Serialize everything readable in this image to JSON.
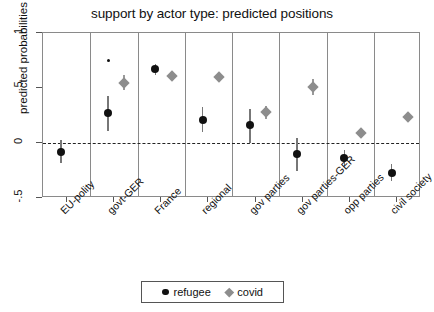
{
  "chart_data": {
    "type": "scatter",
    "title": "support by actor type: predicted positions",
    "xlabel": "",
    "ylabel": "predicted probabilities",
    "ylim": [
      -0.5,
      1.0
    ],
    "yticks": [
      1,
      0.5,
      0,
      -0.5
    ],
    "ytick_labels": [
      "1",
      ".5",
      "0",
      "-.5"
    ],
    "grid": false,
    "panel_separators": true,
    "reference_line": {
      "y": 0,
      "style": "dashed"
    },
    "categories": [
      "EU-polity",
      "govt-GER",
      "France",
      "regional",
      "gov parties",
      "gov parties-GER",
      "opp parties",
      "civil society"
    ],
    "legend": {
      "position": "bottom",
      "entries": [
        {
          "name": "refugee",
          "marker": "circle",
          "color": "#111111"
        },
        {
          "name": "covid",
          "marker": "diamond",
          "color": "#8d8d8d"
        }
      ]
    },
    "series": [
      {
        "name": "refugee",
        "marker": "circle",
        "color": "#111111",
        "points": [
          {
            "category": "EU-polity",
            "value": -0.08,
            "lo": -0.18,
            "hi": 0.03
          },
          {
            "category": "govt-GER",
            "value": 0.27,
            "lo": 0.11,
            "hi": 0.43
          },
          {
            "category": "France",
            "value": 0.67,
            "lo": 0.62,
            "hi": 0.72
          },
          {
            "category": "regional",
            "value": 0.21,
            "lo": 0.1,
            "hi": 0.33
          },
          {
            "category": "gov parties",
            "value": 0.16,
            "lo": 0.0,
            "hi": 0.31
          },
          {
            "category": "gov parties-GER",
            "value": -0.1,
            "lo": -0.25,
            "hi": 0.05
          },
          {
            "category": "opp parties",
            "value": -0.14,
            "lo": -0.21,
            "hi": -0.06
          },
          {
            "category": "civil society",
            "value": -0.27,
            "lo": -0.35,
            "hi": -0.19
          }
        ],
        "extra_points": [
          {
            "category": "govt-GER",
            "value": 0.75,
            "size": "small"
          }
        ]
      },
      {
        "name": "covid",
        "marker": "diamond",
        "color": "#8d8d8d",
        "points": [
          {
            "category": "govt-GER",
            "value": 0.55,
            "lo": 0.48,
            "hi": 0.62
          },
          {
            "category": "France",
            "value": 0.61,
            "lo": 0.58,
            "hi": 0.64
          },
          {
            "category": "regional",
            "value": 0.6,
            "lo": 0.57,
            "hi": 0.63
          },
          {
            "category": "gov parties",
            "value": 0.28,
            "lo": 0.22,
            "hi": 0.34
          },
          {
            "category": "gov parties-GER",
            "value": 0.51,
            "lo": 0.44,
            "hi": 0.58
          },
          {
            "category": "opp parties",
            "value": 0.09,
            "lo": 0.05,
            "hi": 0.13
          },
          {
            "category": "civil society",
            "value": 0.24,
            "lo": 0.21,
            "hi": 0.27
          }
        ]
      }
    ]
  }
}
